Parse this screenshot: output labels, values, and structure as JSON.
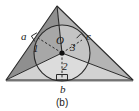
{
  "figure": {
    "caption": "(b)",
    "caption_pos": {
      "x": 56,
      "y": 98
    },
    "colors": {
      "region_1_fill": "#8f8f8f",
      "region_2_fill": "#d2d2d2",
      "region_3_fill": "#b4b4b4",
      "circle_fill": "#c8c8c8",
      "stroke": "#2b2b2b",
      "label": "#1a1a1a",
      "background": "#ffffff"
    },
    "geometry": {
      "triangle_vertices": [
        {
          "name": "apex",
          "x": 57,
          "y": 6
        },
        {
          "name": "bottom-left",
          "x": 6,
          "y": 80
        },
        {
          "name": "bottom-right",
          "x": 133,
          "y": 80
        }
      ],
      "incircle": {
        "cx": 62,
        "cy": 53,
        "r": 28
      },
      "incenter": {
        "x": 62,
        "y": 53
      },
      "tangent_points": [
        {
          "side": "a",
          "x": 38,
          "y": 38
        },
        {
          "side": "b",
          "x": 62,
          "y": 80
        },
        {
          "side": "c",
          "x": 82,
          "y": 40
        }
      ]
    },
    "labels": {
      "side_a": {
        "text": "a",
        "x": 21,
        "y": 31
      },
      "side_b": {
        "text": "b",
        "x": 60,
        "y": 84
      },
      "side_c": {
        "text": "c",
        "x": 86,
        "y": 31
      },
      "center_O": {
        "text": "O",
        "x": 56,
        "y": 35
      },
      "region_1": {
        "text": "1",
        "x": 33,
        "y": 43
      },
      "region_2": {
        "text": "2",
        "x": 62,
        "y": 61
      },
      "region_3": {
        "text": "3",
        "x": 70,
        "y": 42
      }
    }
  }
}
